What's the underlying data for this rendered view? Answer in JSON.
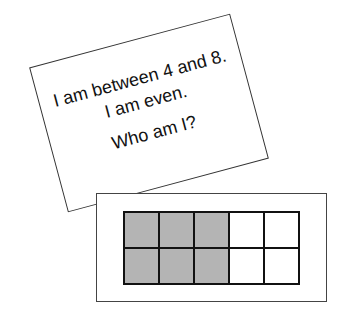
{
  "card": {
    "lines": [
      "I am between 4 and 8.",
      "I am even.",
      "Who am I?"
    ]
  },
  "ten_frame": {
    "rows": 2,
    "columns": 5,
    "filled_count": 6,
    "filled_color": "#b4b4b4",
    "cells": [
      [
        true,
        true,
        true,
        false,
        false
      ],
      [
        true,
        true,
        true,
        false,
        false
      ]
    ]
  }
}
